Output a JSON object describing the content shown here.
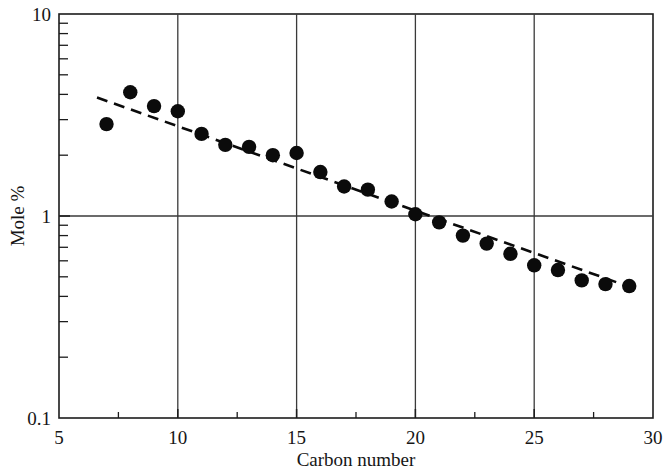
{
  "chart_data": {
    "type": "scatter",
    "title": "",
    "xlabel": "Carbon number",
    "ylabel": "Mole %",
    "yscale": "log",
    "xscale": "linear",
    "xlim": [
      5,
      30
    ],
    "ylim": [
      0.1,
      10
    ],
    "grid": true,
    "legend": null,
    "xticks": [
      5,
      10,
      15,
      20,
      25,
      30
    ],
    "xtick_labels": [
      "5",
      "10",
      "15",
      "20",
      "25",
      "30"
    ],
    "xminor_ticks": [
      7.5,
      12.5,
      17.5,
      22.5,
      27.5
    ],
    "yticks": [
      0.1,
      1,
      10
    ],
    "ytick_labels": [
      "0.1",
      "1",
      "10"
    ],
    "gridlines_x": [
      10,
      15,
      20,
      25
    ],
    "gridlines_y": [
      1
    ],
    "series": [
      {
        "name": "Mole % vs carbon number",
        "marker": "filled-circle",
        "x": [
          7,
          8,
          9,
          10,
          11,
          12,
          13,
          14,
          15,
          16,
          17,
          18,
          19,
          20,
          21,
          22,
          23,
          24,
          25,
          26,
          27,
          28,
          29
        ],
        "y": [
          2.85,
          4.1,
          3.5,
          3.3,
          2.55,
          2.25,
          2.2,
          2.0,
          2.05,
          1.65,
          1.4,
          1.35,
          1.18,
          1.02,
          0.93,
          0.8,
          0.73,
          0.65,
          0.57,
          0.54,
          0.48,
          0.46,
          0.45
        ]
      }
    ],
    "trend_line": {
      "style": "dashed",
      "x_start": 6.6,
      "y_start": 3.86,
      "x_end": 28.8,
      "y_end": 0.455
    }
  },
  "axis": {
    "x_tick_labels": [
      "5",
      "10",
      "15",
      "20",
      "25",
      "30"
    ],
    "y_tick_labels": [
      "10",
      "1",
      "0.1"
    ],
    "x_title": "Carbon number",
    "y_title": "Mole %"
  }
}
